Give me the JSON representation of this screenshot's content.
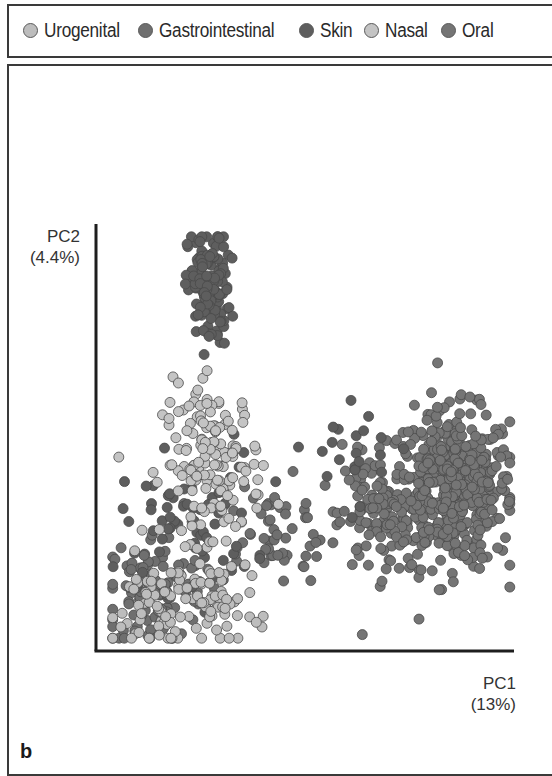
{
  "legend": {
    "items": [
      {
        "label": "Urogenital",
        "color": "#bdbdbd"
      },
      {
        "label": "Gastrointestinal",
        "color": "#6f6f6f"
      },
      {
        "label": "Skin",
        "color": "#5e5e5e"
      },
      {
        "label": "Nasal",
        "color": "#c4c4c4"
      },
      {
        "label": "Oral",
        "color": "#757575"
      }
    ]
  },
  "axes": {
    "y_label": "PC2",
    "y_pct": "(4.4%)",
    "x_label": "PC1",
    "x_pct": "(13%)"
  },
  "panel_label": "b",
  "chart_data": {
    "type": "scatter",
    "title": "",
    "xlabel": "PC1 (13%)",
    "ylabel": "PC2 (4.4%)",
    "grid": false,
    "legend_position": "top",
    "ticks": "none",
    "series": [
      {
        "name": "Urogenital",
        "color": "#bdbdbd",
        "clusters": [
          {
            "cx": 0.18,
            "cy": 0.1,
            "sx": 0.08,
            "sy": 0.06,
            "n": 90
          },
          {
            "cx": 0.3,
            "cy": 0.12,
            "sx": 0.05,
            "sy": 0.05,
            "n": 25
          }
        ]
      },
      {
        "name": "Gastrointestinal",
        "color": "#6f6f6f",
        "clusters": [
          {
            "cx": 0.14,
            "cy": 0.14,
            "sx": 0.06,
            "sy": 0.07,
            "n": 110
          },
          {
            "cx": 0.42,
            "cy": 0.28,
            "sx": 0.08,
            "sy": 0.06,
            "n": 60
          }
        ]
      },
      {
        "name": "Skin",
        "color": "#5e5e5e",
        "clusters": [
          {
            "cx": 0.27,
            "cy": 0.85,
            "sx": 0.025,
            "sy": 0.07,
            "n": 140
          },
          {
            "cx": 0.22,
            "cy": 0.3,
            "sx": 0.08,
            "sy": 0.08,
            "n": 70
          },
          {
            "cx": 0.6,
            "cy": 0.48,
            "sx": 0.09,
            "sy": 0.07,
            "n": 22
          }
        ]
      },
      {
        "name": "Nasal",
        "color": "#c4c4c4",
        "clusters": [
          {
            "cx": 0.28,
            "cy": 0.44,
            "sx": 0.06,
            "sy": 0.09,
            "n": 150
          }
        ]
      },
      {
        "name": "Oral",
        "color": "#757575",
        "clusters": [
          {
            "cx": 0.85,
            "cy": 0.38,
            "sx": 0.075,
            "sy": 0.09,
            "n": 520
          },
          {
            "cx": 0.66,
            "cy": 0.32,
            "sx": 0.04,
            "sy": 0.07,
            "n": 80
          }
        ]
      }
    ],
    "plot_area_px": {
      "x0": 96,
      "y0": 224,
      "x1": 514,
      "y1": 651
    }
  }
}
